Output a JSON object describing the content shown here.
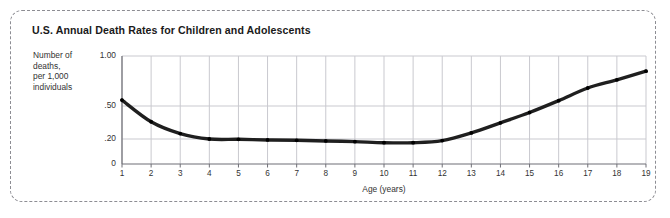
{
  "panel": {
    "title": "U.S. Annual Death Rates for Children and Adolescents",
    "axis_label_lines": [
      "Number of",
      "deaths,",
      "per 1,000",
      "individuals"
    ]
  },
  "chart_data": {
    "type": "line",
    "title": "U.S. Annual Death Rates for Children and Adolescents",
    "subtitle": "",
    "xlabel": "Age (years)",
    "ylabel": "Number of deaths, per 1,000 individuals",
    "x": [
      1,
      2,
      3,
      4,
      5,
      6,
      7,
      8,
      9,
      10,
      11,
      12,
      13,
      14,
      15,
      16,
      17,
      18,
      19
    ],
    "xtick_labels": [
      "1",
      "2",
      "3",
      "4",
      "5",
      "6",
      "7",
      "8",
      "9",
      "10",
      "11",
      "12",
      "13",
      "14",
      "15",
      "16",
      "17",
      "18",
      "19"
    ],
    "values": [
      0.55,
      0.34,
      0.24,
      0.2,
      0.195,
      0.185,
      0.18,
      0.17,
      0.16,
      0.145,
      0.145,
      0.175,
      0.245,
      0.33,
      0.43,
      0.545,
      0.66,
      0.74,
      0.83
    ],
    "ytick_labels": [
      "0",
      ".20",
      ".50",
      "1.00"
    ],
    "ytick_values": [
      0,
      0.2,
      0.5,
      1.0
    ],
    "ylim": [
      0,
      1.0
    ],
    "yscale": "nonlinear-log-like",
    "xlim": [
      1,
      19
    ],
    "grid": true,
    "legend": false,
    "legend_position": "none",
    "series": [
      {
        "name": "Annual death rate",
        "color": "#1f1f1f",
        "marker": "dot",
        "values": [
          0.55,
          0.34,
          0.24,
          0.2,
          0.195,
          0.185,
          0.18,
          0.17,
          0.16,
          0.145,
          0.145,
          0.175,
          0.245,
          0.33,
          0.43,
          0.545,
          0.66,
          0.74,
          0.83
        ]
      }
    ],
    "colors": {
      "line": "#1f1f1f",
      "grid": "#c9c9cf",
      "axis": "#6f6f76",
      "text": "#333333",
      "frame": "#8d8d93"
    }
  }
}
